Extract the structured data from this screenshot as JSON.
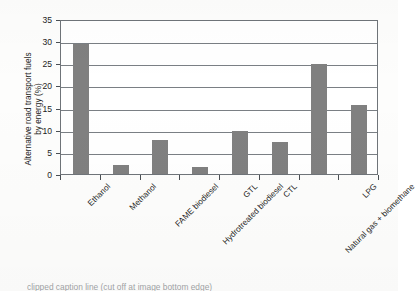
{
  "chart_data": {
    "type": "bar",
    "title": "",
    "xlabel": "",
    "ylabel": "Alternative road transport fuels by energy (%)",
    "ylabel_line1": "Alternative road transport fuels",
    "ylabel_line2": "by energy (%)",
    "ylim": [
      0,
      35
    ],
    "ytick_step": 5,
    "yticks": [
      "0",
      "5",
      "10",
      "15",
      "20",
      "25",
      "30",
      "35"
    ],
    "grid": true,
    "legend": "none",
    "bar_color": "#808080",
    "frame_color": "#6f7479",
    "categories": [
      "Ethanol",
      "Methanol",
      "FAME biodiesel",
      "Hydrotreated biodiesel",
      "GTL",
      "CTL",
      "Natural gas + biomethane",
      "LPG"
    ],
    "values": [
      29.3,
      2.0,
      7.7,
      1.6,
      9.7,
      7.2,
      24.8,
      15.5
    ]
  },
  "caption": {
    "text": "clipped caption line (cut off at image bottom edge)"
  }
}
